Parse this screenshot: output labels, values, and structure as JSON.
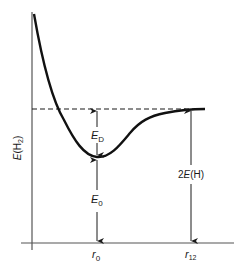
{
  "diagram": {
    "type": "potential-energy-curve",
    "y_axis_label": {
      "main": "E",
      "paren_open": "(H",
      "sub": "2",
      "paren_close": ")"
    },
    "x_ticks": [
      {
        "main": "r",
        "sub": "0"
      },
      {
        "main": "r",
        "sub": "12"
      }
    ],
    "annotations": {
      "dissociation_energy": {
        "main": "E",
        "sub": "D"
      },
      "zero_point": {
        "main": "E",
        "sub": "0"
      },
      "atom_energy": {
        "prefix": "2",
        "main": "E",
        "suffix": "(H)"
      }
    },
    "colors": {
      "ink": "#1a1a1a",
      "background": "#ffffff"
    }
  }
}
